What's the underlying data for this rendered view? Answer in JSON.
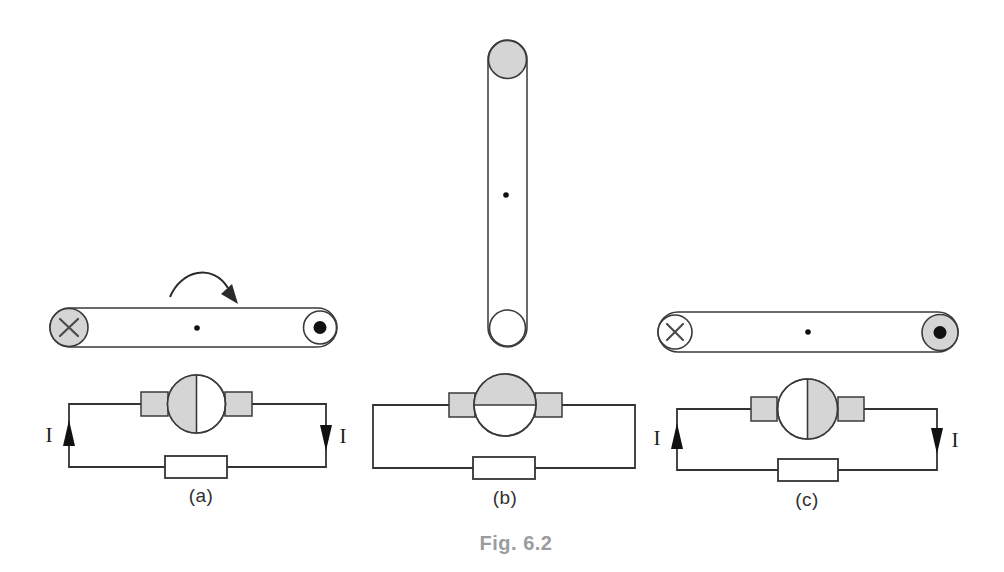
{
  "figure": {
    "caption": "Fig. 6.2",
    "caption_color": "#9b9c9e",
    "line_color": "#333333",
    "shade_color": "#d5d5d5",
    "icons": {
      "current_into_page": "circle-with-x-cross",
      "current_out_of_page": "circle-with-filled-dot",
      "rotation_direction": "clockwise-curved-arrow",
      "pivot": "small-dot",
      "resistor": "open-rectangle",
      "brush": "shaded-rectangle"
    },
    "panels": [
      {
        "label": "(a)",
        "coil_orientation": "horizontal",
        "left_end_symbol": "current-into-page",
        "right_end_symbol": "current-out-of-page",
        "commutator_shaded_half": "left",
        "has_rotation_arrow": true,
        "current_labels": {
          "left": "I",
          "right": "I"
        }
      },
      {
        "label": "(b)",
        "coil_orientation": "vertical",
        "top_end_symbol": "shaded-circle",
        "bottom_end_symbol": "open-circle",
        "commutator_shaded_half": "top",
        "has_rotation_arrow": false,
        "current_labels": {}
      },
      {
        "label": "(c)",
        "coil_orientation": "horizontal",
        "left_end_symbol": "current-into-page",
        "right_end_symbol": "current-out-of-page",
        "commutator_shaded_half": "right",
        "has_rotation_arrow": false,
        "current_labels": {
          "left": "I",
          "right": "I"
        }
      }
    ]
  }
}
